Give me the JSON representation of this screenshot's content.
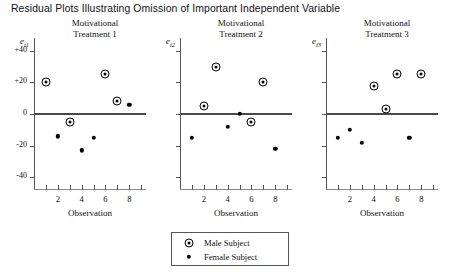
{
  "figure": {
    "title": "Residual Plots Illustrating Omission of Important Independent Variable"
  },
  "legend": {
    "male_label": "Male Subject",
    "female_label": "Female Subject",
    "male_marker": "circled-dot-marker",
    "female_marker": "solid-dot-marker"
  },
  "axes": {
    "xlabel": "Observation",
    "xticks": [
      1,
      2,
      3,
      4,
      5,
      6,
      7,
      8,
      9
    ],
    "xtick_labels": [
      "",
      "2",
      "",
      "4",
      "",
      "6",
      "",
      "8",
      ""
    ],
    "yticks": [
      40,
      20,
      0,
      -20,
      -40
    ],
    "ytick_labels": [
      "+40",
      "+20",
      "0",
      "-20",
      "-40"
    ],
    "xlim": [
      0,
      9.4
    ],
    "ylim": [
      -48,
      48
    ]
  },
  "panels": [
    {
      "id": "panel-1",
      "subtitle_line1": "Motivational",
      "subtitle_line2": "Treatment 1",
      "ylabel": "e",
      "ylabel_sub": "i1"
    },
    {
      "id": "panel-2",
      "subtitle_line1": "Motivational",
      "subtitle_line2": "Treatment 2",
      "ylabel": "e",
      "ylabel_sub": "i2"
    },
    {
      "id": "panel-3",
      "subtitle_line1": "Motivational",
      "subtitle_line2": "Treatment 3",
      "ylabel": "e",
      "ylabel_sub": "i3"
    }
  ],
  "chart_data": [
    {
      "type": "scatter",
      "title": "Motivational Treatment 1",
      "xlabel": "Observation",
      "ylabel": "e_i1",
      "xlim": [
        0,
        9.4
      ],
      "ylim": [
        -48,
        48
      ],
      "grid": false,
      "legend_position": "bottom-center",
      "series": [
        {
          "name": "Male Subject",
          "marker": "circled-dot",
          "x": [
            1,
            3,
            6,
            7
          ],
          "y": [
            20,
            -5,
            25,
            8
          ]
        },
        {
          "name": "Female Subject",
          "marker": "solid-dot",
          "x": [
            2,
            4,
            5,
            8
          ],
          "y": [
            -14,
            -23,
            -15,
            6
          ]
        }
      ]
    },
    {
      "type": "scatter",
      "title": "Motivational Treatment 2",
      "xlabel": "Observation",
      "ylabel": "e_i2",
      "xlim": [
        0,
        9.4
      ],
      "ylim": [
        -48,
        48
      ],
      "grid": false,
      "legend_position": "bottom-center",
      "series": [
        {
          "name": "Male Subject",
          "marker": "circled-dot",
          "x": [
            2,
            3,
            6,
            7
          ],
          "y": [
            5,
            30,
            -5,
            20
          ]
        },
        {
          "name": "Female Subject",
          "marker": "solid-dot",
          "x": [
            1,
            4,
            5,
            8
          ],
          "y": [
            -15,
            -8,
            0,
            -22
          ]
        }
      ]
    },
    {
      "type": "scatter",
      "title": "Motivational Treatment 3",
      "xlabel": "Observation",
      "ylabel": "e_i3",
      "xlim": [
        0,
        9.4
      ],
      "ylim": [
        -48,
        48
      ],
      "grid": false,
      "legend_position": "bottom-center",
      "series": [
        {
          "name": "Male Subject",
          "marker": "circled-dot",
          "x": [
            4,
            5,
            6,
            8
          ],
          "y": [
            18,
            3,
            25,
            25
          ]
        },
        {
          "name": "Female Subject",
          "marker": "solid-dot",
          "x": [
            1,
            2,
            3,
            7
          ],
          "y": [
            -15,
            -10,
            -18,
            -15
          ]
        }
      ]
    }
  ]
}
